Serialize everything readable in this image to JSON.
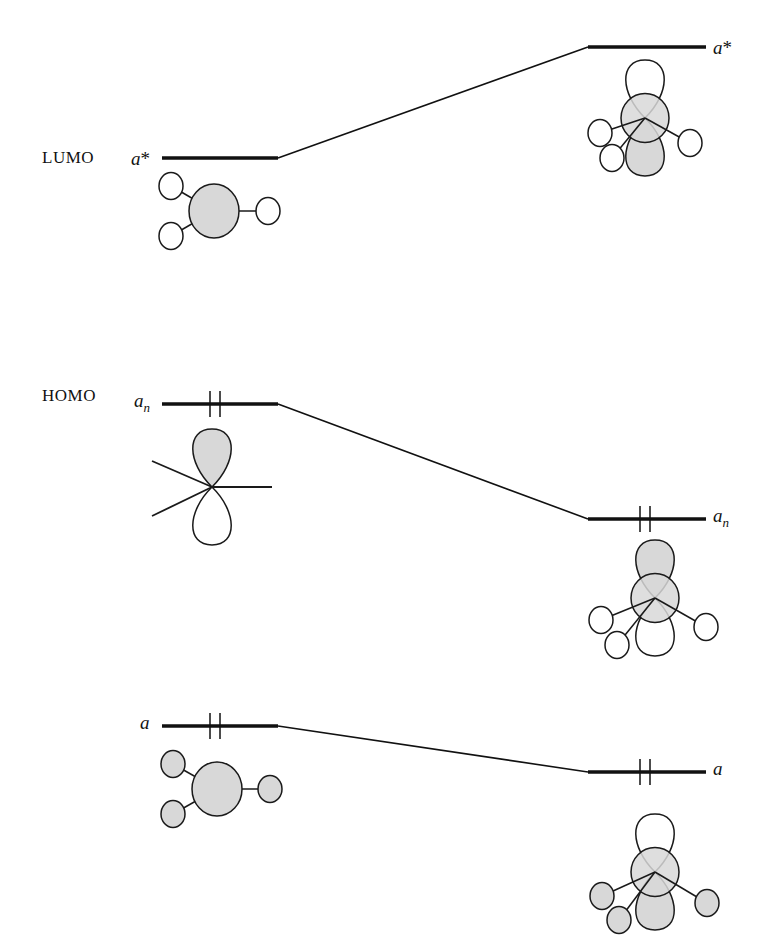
{
  "diagram": {
    "type": "molecular-orbital-correlation",
    "colors": {
      "line": "#111111",
      "orbital_fill_shaded": "#d8d8d8",
      "orbital_fill_empty": "#ffffff",
      "stroke": "#1a1a1a",
      "background": "#ffffff"
    },
    "side_labels": [
      {
        "id": "lumo",
        "text": "LUMO",
        "x": 42,
        "y": 148
      },
      {
        "id": "homo",
        "text": "HOMO",
        "x": 42,
        "y": 386
      }
    ],
    "levels": [
      {
        "id": "left-a-star",
        "side": "left",
        "label": "a*",
        "label_html": "a<span class=\"sup\">*</span>",
        "label_x": 131,
        "label_y": 148,
        "line": {
          "x1": 162,
          "y1": 158,
          "x2": 278,
          "y2": 158
        },
        "electrons": 0,
        "electron_ticks": []
      },
      {
        "id": "right-a-star",
        "side": "right",
        "label": "a*",
        "label_html": "a<span class=\"sup\">*</span>",
        "label_x": 713,
        "label_y": 37,
        "line": {
          "x1": 588,
          "y1": 47,
          "x2": 706,
          "y2": 47
        },
        "electrons": 0,
        "electron_ticks": []
      },
      {
        "id": "left-a-n",
        "side": "left",
        "label": "an",
        "label_html": "a<span class=\"sub\">n</span>",
        "label_x": 134,
        "label_y": 390,
        "line": {
          "x1": 162,
          "y1": 404,
          "x2": 278,
          "y2": 404
        },
        "electrons": 2,
        "electron_ticks": [
          210,
          220
        ]
      },
      {
        "id": "right-a-n",
        "side": "right",
        "label": "an",
        "label_html": "a<span class=\"sub\">n</span>",
        "label_x": 713,
        "label_y": 505,
        "line": {
          "x1": 588,
          "y1": 519,
          "x2": 706,
          "y2": 519
        },
        "electrons": 2,
        "electron_ticks": [
          640,
          650
        ]
      },
      {
        "id": "left-a",
        "side": "left",
        "label": "a",
        "label_html": "a",
        "label_x": 140,
        "label_y": 712,
        "line": {
          "x1": 162,
          "y1": 726,
          "x2": 278,
          "y2": 726
        },
        "electrons": 2,
        "electron_ticks": [
          210,
          220
        ]
      },
      {
        "id": "right-a",
        "side": "right",
        "label": "a",
        "label_html": "a",
        "label_x": 713,
        "label_y": 758,
        "line": {
          "x1": 588,
          "y1": 772,
          "x2": 706,
          "y2": 772
        },
        "electrons": 2,
        "electron_ticks": [
          640,
          650
        ]
      }
    ],
    "correlation_lines": [
      {
        "id": "corr-a-star",
        "from": "left-a-star",
        "x1": 278,
        "y1": 158,
        "x2": 588,
        "y2": 47
      },
      {
        "id": "corr-a-n",
        "from": "left-a-n",
        "x1": 278,
        "y1": 404,
        "x2": 588,
        "y2": 519
      },
      {
        "id": "corr-a",
        "from": "left-a",
        "x1": 278,
        "y1": 726,
        "x2": 588,
        "y2": 772
      }
    ],
    "orbital_pictograms": [
      {
        "id": "left-a-star-orbital",
        "for_level": "left-a-star",
        "kind": "central-sphere-with-three-ligands",
        "center": {
          "x": 214,
          "y": 211
        },
        "center_radius": 25,
        "center_shaded": true,
        "ligands": [
          {
            "x": 171,
            "y": 186,
            "r": 12,
            "shaded": false
          },
          {
            "x": 171,
            "y": 236,
            "r": 12,
            "shaded": false
          },
          {
            "x": 268,
            "y": 211,
            "r": 12,
            "shaded": false
          }
        ]
      },
      {
        "id": "right-a-star-orbital",
        "for_level": "right-a-star",
        "kind": "p-orbital-on-sphere-with-three-ligands",
        "center": {
          "x": 645,
          "y": 118
        },
        "center_radius": 24,
        "center_shaded": true,
        "lobe_up_shaded": false,
        "lobe_down_shaded": true,
        "ligands": [
          {
            "x": 600,
            "y": 133,
            "r": 12,
            "shaded": false
          },
          {
            "x": 612,
            "y": 158,
            "r": 12,
            "shaded": false
          },
          {
            "x": 690,
            "y": 143,
            "r": 12,
            "shaded": false
          }
        ]
      },
      {
        "id": "left-a-n-orbital",
        "for_level": "left-a-n",
        "kind": "bare-p-orbital-with-three-bonds",
        "center": {
          "x": 212,
          "y": 487
        },
        "lobe_up_shaded": true,
        "lobe_down_shaded": false,
        "bonds": [
          {
            "x": 152,
            "y": 461
          },
          {
            "x": 152,
            "y": 516
          },
          {
            "x": 272,
            "y": 487
          }
        ]
      },
      {
        "id": "right-a-n-orbital",
        "for_level": "right-a-n",
        "kind": "p-orbital-on-sphere-with-three-ligands",
        "center": {
          "x": 655,
          "y": 598
        },
        "center_radius": 24,
        "center_shaded": true,
        "lobe_up_shaded": true,
        "lobe_down_shaded": false,
        "ligands": [
          {
            "x": 601,
            "y": 620,
            "r": 12,
            "shaded": false
          },
          {
            "x": 617,
            "y": 645,
            "r": 12,
            "shaded": false
          },
          {
            "x": 706,
            "y": 627,
            "r": 12,
            "shaded": false
          }
        ]
      },
      {
        "id": "left-a-orbital",
        "for_level": "left-a",
        "kind": "central-sphere-with-three-ligands",
        "center": {
          "x": 217,
          "y": 789
        },
        "center_radius": 25,
        "center_shaded": true,
        "ligands": [
          {
            "x": 173,
            "y": 764,
            "r": 12,
            "shaded": true
          },
          {
            "x": 173,
            "y": 814,
            "r": 12,
            "shaded": true
          },
          {
            "x": 270,
            "y": 789,
            "r": 12,
            "shaded": true
          }
        ]
      },
      {
        "id": "right-a-orbital",
        "for_level": "right-a",
        "kind": "p-orbital-on-sphere-with-three-ligands",
        "center": {
          "x": 655,
          "y": 872
        },
        "center_radius": 24,
        "center_shaded": true,
        "lobe_up_shaded": false,
        "lobe_down_shaded": true,
        "ligands": [
          {
            "x": 602,
            "y": 896,
            "r": 12,
            "shaded": true
          },
          {
            "x": 619,
            "y": 920,
            "r": 12,
            "shaded": true
          },
          {
            "x": 707,
            "y": 903,
            "r": 12,
            "shaded": true
          }
        ]
      }
    ]
  }
}
